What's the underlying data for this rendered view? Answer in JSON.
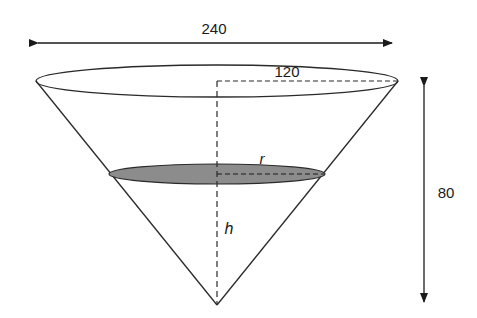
{
  "diagram": {
    "type": "cone-with-cross-section",
    "labels": {
      "diameter": "240",
      "radius_top": "120",
      "height_total": "80",
      "section_radius": "r",
      "section_height": "h"
    },
    "colors": {
      "stroke": "#2a2a2a",
      "section_fill": "#8c8c8c",
      "background": "#ffffff"
    }
  }
}
